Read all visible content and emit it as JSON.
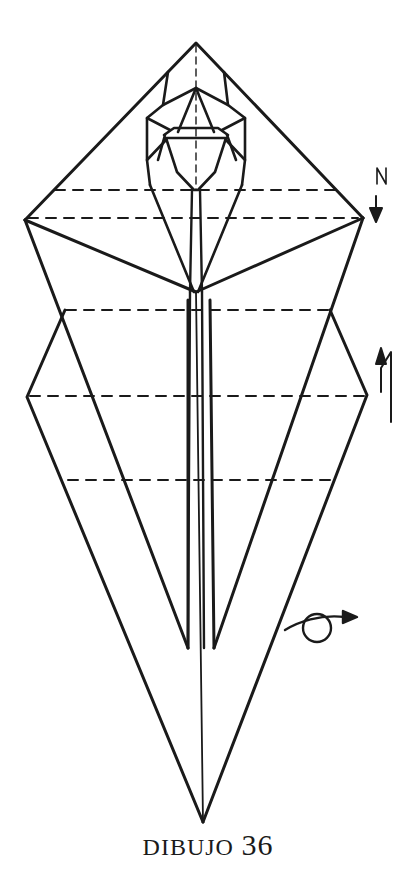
{
  "figure": {
    "caption_word": "DIBUJO",
    "caption_number": "36",
    "stroke_color": "#1a1a1a",
    "background": "#ffffff"
  },
  "symbols": {
    "mountain_fold_arrow": {
      "label": "N",
      "icon": "arrow-down-icon"
    },
    "valley_fold_arrow": {
      "label": "N",
      "icon": "arrow-up-icon"
    },
    "turn_over": {
      "icon": "turn-over-icon"
    }
  },
  "fold_lines": {
    "dashed_y": [
      190,
      218,
      310,
      396,
      480
    ]
  }
}
